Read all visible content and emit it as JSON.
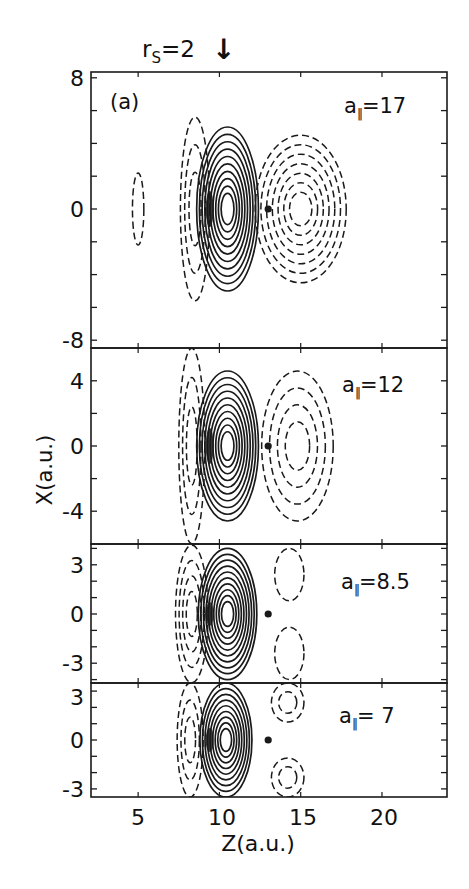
{
  "figure": {
    "panel_tag": "(a)",
    "rs_label": "r",
    "rs_sub": "S",
    "rs_value": "=2",
    "arrow": "↓",
    "xlabel": "Z(a.u.)",
    "ylabel": "X(a.u.)"
  },
  "panels": [
    {
      "param_sym": "a",
      "param_sub": "‖",
      "param_value": "=17",
      "yticks": [
        "8",
        "0",
        "-8"
      ]
    },
    {
      "param_sym": "a",
      "param_sub": "‖",
      "param_value": "=12",
      "yticks": [
        "4",
        "0",
        "-4"
      ]
    },
    {
      "param_sym": "a",
      "param_sub": "‖",
      "param_value": "=8.5",
      "yticks": [
        "3",
        "0",
        "-3"
      ]
    },
    {
      "param_sym": "a",
      "param_sub": "‖",
      "param_value": "= 7",
      "yticks": [
        "3",
        "0",
        "-3"
      ]
    }
  ],
  "xticks": [
    "5",
    "10",
    "15",
    "20"
  ],
  "chart_data": {
    "type": "contour",
    "title": "",
    "annotation_top": "r_s = 2 (arrow at Z = 10)",
    "xlabel": "Z(a.u.)",
    "ylabel": "X(a.u.)",
    "xlim": [
      2.1,
      24.0
    ],
    "xticks": [
      5,
      10,
      15,
      20
    ],
    "grid": false,
    "legend": "none (solid = positive contours, dashed = negative contours)",
    "arrow_marker_z": 10,
    "ion_position": {
      "z": 13.0,
      "x": 0
    },
    "panels": [
      {
        "label": "a∥ = 17",
        "param": 17,
        "ylim": [
          -8.5,
          8.4
        ],
        "yticks_labeled": [
          8,
          0,
          -8
        ],
        "ytick_step": 2,
        "features": [
          {
            "sign": "positive",
            "style": "solid",
            "center_z": 10.5,
            "center_x": 0,
            "half_width_z": 1.9,
            "half_height_x": 5.0,
            "n_contours": 10
          },
          {
            "sign": "negative",
            "style": "dashed",
            "center_z": 15.0,
            "center_x": 0,
            "half_width_z": 2.8,
            "half_height_x": 4.5,
            "n_contours": 7
          },
          {
            "sign": "negative",
            "style": "dashed",
            "center_z": 8.5,
            "center_x": 0,
            "half_width_z": 0.9,
            "half_height_x": 5.6,
            "n_contours": 3
          },
          {
            "sign": "negative",
            "style": "dashed",
            "center_z": 5.0,
            "center_x": 0,
            "half_width_z": 0.35,
            "half_height_x": 2.2,
            "n_contours": 1
          }
        ]
      },
      {
        "label": "a∥ = 12",
        "param": 12,
        "ylim": [
          -6.0,
          6.0
        ],
        "yticks_labeled": [
          4,
          0,
          -4
        ],
        "ytick_step": 2,
        "features": [
          {
            "sign": "positive",
            "style": "solid",
            "center_z": 10.5,
            "center_x": 0,
            "half_width_z": 1.9,
            "half_height_x": 4.6,
            "n_contours": 10
          },
          {
            "sign": "negative",
            "style": "dashed",
            "center_z": 14.8,
            "center_x": 0,
            "half_width_z": 2.2,
            "half_height_x": 4.6,
            "n_contours": 4
          },
          {
            "sign": "negative",
            "style": "dashed",
            "center_z": 8.3,
            "center_x": 0,
            "half_width_z": 0.8,
            "half_height_x": 6.0,
            "n_contours": 3
          }
        ]
      },
      {
        "label": "a∥ = 8.5",
        "param": 8.5,
        "ylim": [
          -4.2,
          4.3
        ],
        "yticks_labeled": [
          3,
          0,
          -3
        ],
        "ytick_step": 1,
        "features": [
          {
            "sign": "positive",
            "style": "solid",
            "center_z": 10.5,
            "center_x": 0,
            "half_width_z": 1.8,
            "half_height_x": 4.0,
            "n_contours": 10
          },
          {
            "sign": "negative",
            "style": "dashed",
            "center_z": 14.3,
            "center_x": 2.4,
            "half_width_z": 0.9,
            "half_height_x": 1.6,
            "n_contours": 1
          },
          {
            "sign": "negative",
            "style": "dashed",
            "center_z": 14.3,
            "center_x": -2.4,
            "half_width_z": 0.9,
            "half_height_x": 1.6,
            "n_contours": 1
          },
          {
            "sign": "negative",
            "style": "dashed",
            "center_z": 8.3,
            "center_x": 0,
            "half_width_z": 1.0,
            "half_height_x": 4.2,
            "n_contours": 4
          }
        ]
      },
      {
        "label": "a∥ = 7",
        "param": 7,
        "ylim": [
          -3.5,
          3.5
        ],
        "yticks_labeled": [
          3,
          0,
          -3
        ],
        "ytick_step": 1,
        "features": [
          {
            "sign": "positive",
            "style": "solid",
            "center_z": 10.4,
            "center_x": 0,
            "half_width_z": 1.6,
            "half_height_x": 3.5,
            "n_contours": 9
          },
          {
            "sign": "negative",
            "style": "dashed",
            "center_z": 14.2,
            "center_x": 2.3,
            "half_width_z": 1.0,
            "half_height_x": 1.2,
            "n_contours": 2
          },
          {
            "sign": "negative",
            "style": "dashed",
            "center_z": 14.2,
            "center_x": -2.3,
            "half_width_z": 1.0,
            "half_height_x": 1.2,
            "n_contours": 2
          },
          {
            "sign": "negative",
            "style": "dashed",
            "center_z": 8.2,
            "center_x": 0,
            "half_width_z": 0.8,
            "half_height_x": 3.5,
            "n_contours": 3
          }
        ]
      }
    ]
  }
}
